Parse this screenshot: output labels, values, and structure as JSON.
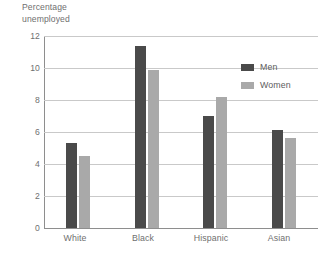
{
  "chart_data": {
    "type": "bar",
    "title": "Percentage\nunemployed",
    "title_line1": "Percentage",
    "title_line2": "unemployed",
    "xlabel": "",
    "ylabel": "Percentage unemployed",
    "ylim": [
      0,
      12
    ],
    "ytick_step": 2,
    "ytick_labels": [
      "0",
      "2",
      "4",
      "6",
      "8",
      "10",
      "12"
    ],
    "ytick_values": [
      0,
      2,
      4,
      6,
      8,
      10,
      12
    ],
    "grid": true,
    "grid_axis": "y",
    "legend_position": "top-right",
    "categories": [
      "White",
      "Black",
      "Hispanic",
      "Asian"
    ],
    "series": [
      {
        "name": "Men",
        "color": "#4a4a4a",
        "values": [
          5.3,
          11.4,
          7.0,
          6.1
        ]
      },
      {
        "name": "Women",
        "color": "#a9a9a9",
        "values": [
          4.5,
          9.9,
          8.2,
          5.6
        ]
      }
    ]
  },
  "legend": {
    "items": [
      {
        "label": "Men",
        "swatch": "men-swatch"
      },
      {
        "label": "Women",
        "swatch": "women-swatch"
      }
    ]
  }
}
